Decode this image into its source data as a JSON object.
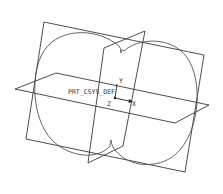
{
  "view": {
    "type": "cad-wireframe",
    "colors": {
      "background": "#ffffff",
      "datum_plane_edge": "#3a3a3a",
      "sketch_curve": "#555555",
      "csys": "#222222"
    }
  },
  "datum_planes": [
    {
      "name": "front-plane"
    },
    {
      "name": "right-plane"
    },
    {
      "name": "top-plane"
    }
  ],
  "sketch": {
    "shape": "two overlapping circles with cusps"
  },
  "csys": {
    "label": "PRT_CSYS_DEF",
    "axes": {
      "x": "X",
      "y": "Y",
      "z": "Z"
    }
  }
}
